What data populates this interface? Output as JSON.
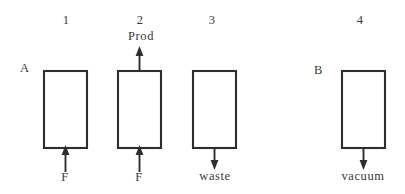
{
  "figure": {
    "width": 405,
    "height": 194,
    "background_color": "#ffffff",
    "ink_color": "#2e2e2e",
    "column_labels": [
      {
        "text": "1",
        "x": 66,
        "y": 14
      },
      {
        "text": "2",
        "x": 140,
        "y": 14
      },
      {
        "text": "3",
        "x": 212,
        "y": 14
      },
      {
        "text": "4",
        "x": 360,
        "y": 14
      }
    ],
    "row_labels": [
      {
        "text": "A",
        "x": 24,
        "y": 62
      },
      {
        "text": "B",
        "x": 318,
        "y": 64
      }
    ],
    "vessels": [
      {
        "id": "vessel-1",
        "x": 44,
        "y": 71,
        "width": 43,
        "height": 77
      },
      {
        "id": "vessel-2",
        "x": 118,
        "y": 71,
        "width": 43,
        "height": 77
      },
      {
        "id": "vessel-3",
        "x": 193,
        "y": 71,
        "width": 43,
        "height": 77
      },
      {
        "id": "vessel-4",
        "x": 342,
        "y": 71,
        "width": 43,
        "height": 77
      }
    ],
    "streams": [
      {
        "id": "stream-feed-1",
        "label": "F",
        "direction": "up",
        "position": "bottom",
        "line_x": 65,
        "line_y_start": 172,
        "line_y_end": 149,
        "label_x": 65,
        "label_y": 172
      },
      {
        "id": "stream-product-2",
        "label": "Prod",
        "direction": "up",
        "position": "top",
        "line_x": 139,
        "line_y_start": 70,
        "line_y_end": 47,
        "label_x": 140,
        "label_y": 30
      },
      {
        "id": "stream-feed-2",
        "label": "F",
        "direction": "up",
        "position": "bottom",
        "line_x": 139,
        "line_y_start": 172,
        "line_y_end": 149,
        "label_x": 139,
        "label_y": 172
      },
      {
        "id": "stream-waste-3",
        "label": "waste",
        "direction": "down",
        "position": "bottom",
        "line_x": 214,
        "line_y_start": 148,
        "line_y_end": 169,
        "label_x": 215,
        "label_y": 170
      },
      {
        "id": "stream-vacuum-4",
        "label": "vacuum",
        "direction": "down",
        "position": "bottom",
        "line_x": 363,
        "line_y_start": 148,
        "line_y_end": 169,
        "label_x": 363,
        "label_y": 170
      }
    ]
  }
}
